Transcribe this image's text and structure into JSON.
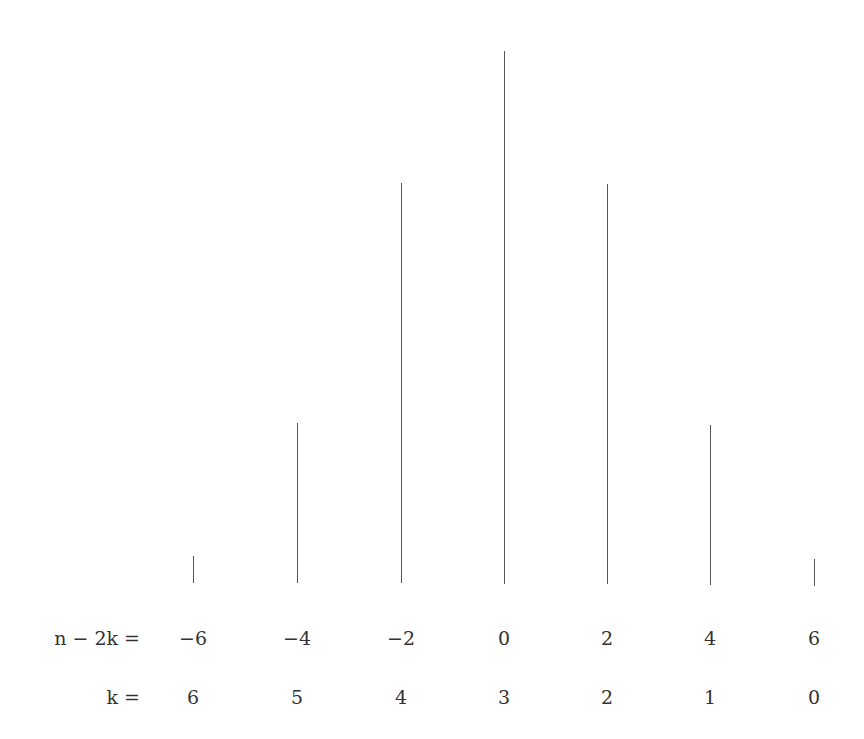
{
  "chart_data": {
    "type": "bar",
    "style": "stem",
    "title": "",
    "xlabel": "",
    "ylabel": "",
    "grid": false,
    "row_labels": {
      "n_minus_2k": "n − 2k =",
      "k": "k ="
    },
    "categories_n_minus_2k": [
      "−6",
      "−4",
      "−2",
      "0",
      "2",
      "4",
      "6"
    ],
    "categories_k": [
      "6",
      "5",
      "4",
      "3",
      "2",
      "1",
      "0"
    ],
    "values": [
      1,
      6,
      15,
      20,
      15,
      6,
      1
    ],
    "ylim": [
      0,
      20
    ]
  },
  "layout": {
    "x_positions": [
      193,
      297,
      401,
      504,
      607,
      710,
      814
    ],
    "baselines": [
      583,
      583,
      583,
      584,
      584,
      585,
      586
    ],
    "unit_px": 26.65
  }
}
